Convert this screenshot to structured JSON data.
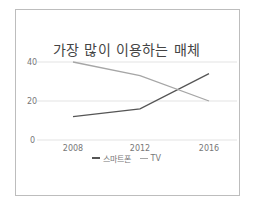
{
  "chart_data": {
    "type": "line",
    "title": "가장 많이 이용하는 매체",
    "categories": [
      "2008",
      "2012",
      "2016"
    ],
    "series": [
      {
        "name": "스마트폰",
        "values": [
          12,
          16,
          34
        ],
        "color": "#555555"
      },
      {
        "name": "TV",
        "values": [
          40,
          33,
          20
        ],
        "color": "#a6a6a6"
      }
    ],
    "xlabel": "",
    "ylabel": "",
    "ylim": [
      0,
      40
    ],
    "yticks": [
      "0",
      "20",
      "40"
    ],
    "grid": true,
    "legend_position": "bottom"
  }
}
